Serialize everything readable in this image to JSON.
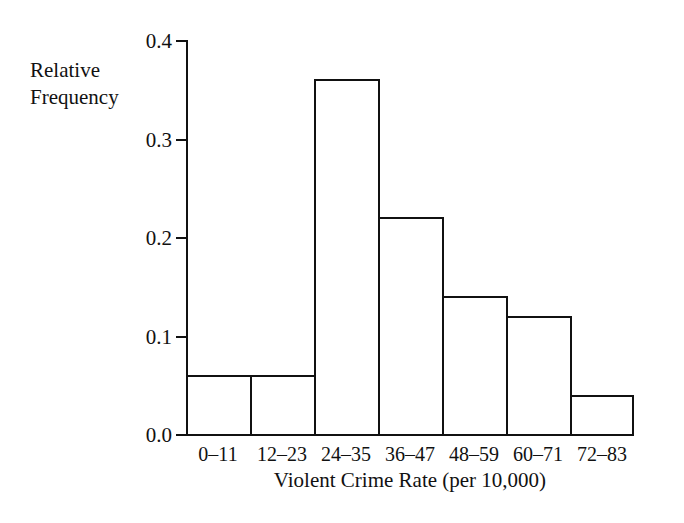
{
  "chart_data": {
    "type": "bar",
    "title": "",
    "subtitle": "",
    "xlabel": "Violent Crime Rate (per 10,000)",
    "ylabel": "Relative\nFrequency",
    "categories": [
      "0–11",
      "12–23",
      "24–35",
      "36–47",
      "48–59",
      "60–71",
      "72–83"
    ],
    "values": [
      0.06,
      0.06,
      0.36,
      0.22,
      0.14,
      0.12,
      0.04
    ],
    "ylim": [
      0.0,
      0.4
    ],
    "ytick_values": [
      0.0,
      0.1,
      0.2,
      0.3,
      0.4
    ],
    "ytick_labels": [
      "0.0",
      "0.1",
      "0.2",
      "0.3",
      "0.4"
    ],
    "grid": false,
    "legend": null,
    "bar_fill": "none",
    "bar_edge_color": "#111111",
    "background_color": "#ffffff",
    "annotations": []
  },
  "axes": {
    "y_label_line1": "Relative",
    "y_label_line2": "Frequency",
    "x_title": "Violent Crime Rate (per 10,000)"
  }
}
